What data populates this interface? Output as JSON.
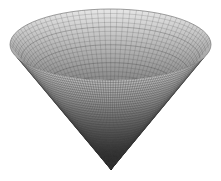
{
  "figure": {
    "width": 221,
    "height": 181,
    "background": "#ffffff"
  },
  "cone": {
    "rim_center": [
      110.5,
      44.5
    ],
    "rim_rx": 100.5,
    "rim_ry": 35.5,
    "apex": [
      111,
      170
    ],
    "radial_lines": 96,
    "ring_lines": 36,
    "mesh_color": "#3a3a3a",
    "colors": {
      "inner_top": "#e6e6e6",
      "inner_bottom": "#8a8a8a",
      "outer_top": "#f2f2f2",
      "outer_mid": "#9a9a9a",
      "outer_bottom": "#111111"
    }
  }
}
